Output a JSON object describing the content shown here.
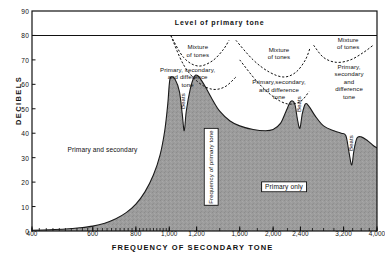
{
  "chart_data": {
    "type": "area",
    "title": "",
    "xlabel": "FREQUENCY OF SECONDARY TONE",
    "ylabel": "DECIBELS",
    "xscale": "log",
    "xlim": [
      400,
      4000
    ],
    "ylim": [
      0,
      90
    ],
    "grid": false,
    "legend": "none",
    "yticks": [
      0,
      10,
      20,
      30,
      40,
      50,
      60,
      70,
      80,
      90
    ],
    "ytick_labels": [
      "0",
      "10",
      "20",
      "30",
      "40",
      "50",
      "60",
      "70",
      "80",
      "90"
    ],
    "xticks": [
      400,
      600,
      800,
      1000,
      1200,
      1600,
      2000,
      2400,
      3200,
      4000
    ],
    "xtick_labels": [
      "400",
      "600",
      "800",
      "1,000",
      "1,200",
      "1,600",
      "2,000",
      "2,400",
      "3,200",
      "4,000"
    ],
    "series": [
      {
        "name": "masking-threshold",
        "type": "area",
        "fill": "#9a9a9a",
        "points": [
          [
            400,
            0.3
          ],
          [
            450,
            0.5
          ],
          [
            500,
            0.8
          ],
          [
            550,
            1.3
          ],
          [
            600,
            2.0
          ],
          [
            650,
            3.2
          ],
          [
            700,
            5.0
          ],
          [
            750,
            7.5
          ],
          [
            800,
            11.0
          ],
          [
            850,
            16.0
          ],
          [
            900,
            23.0
          ],
          [
            940,
            31.0
          ],
          [
            970,
            41.0
          ],
          [
            990,
            52.0
          ],
          [
            1000,
            60.0
          ],
          [
            1010,
            63.0
          ],
          [
            1040,
            62.0
          ],
          [
            1070,
            57.0
          ],
          [
            1090,
            48.0
          ],
          [
            1105,
            41.0
          ],
          [
            1120,
            49.0
          ],
          [
            1150,
            58.0
          ],
          [
            1180,
            63.0
          ],
          [
            1210,
            63.5
          ],
          [
            1260,
            60.0
          ],
          [
            1330,
            54.0
          ],
          [
            1400,
            49.0
          ],
          [
            1500,
            45.0
          ],
          [
            1600,
            43.0
          ],
          [
            1750,
            41.5
          ],
          [
            1900,
            41.0
          ],
          [
            2000,
            41.5
          ],
          [
            2100,
            44.0
          ],
          [
            2180,
            49.0
          ],
          [
            2250,
            53.0
          ],
          [
            2310,
            52.0
          ],
          [
            2350,
            46.0
          ],
          [
            2390,
            42.0
          ],
          [
            2430,
            48.0
          ],
          [
            2480,
            52.0
          ],
          [
            2540,
            51.0
          ],
          [
            2650,
            47.0
          ],
          [
            2800,
            43.0
          ],
          [
            3000,
            41.0
          ],
          [
            3150,
            40.0
          ],
          [
            3250,
            39.0
          ],
          [
            3320,
            32.0
          ],
          [
            3380,
            27.0
          ],
          [
            3430,
            33.0
          ],
          [
            3500,
            38.0
          ],
          [
            3600,
            38.5
          ],
          [
            3750,
            37.0
          ],
          [
            3900,
            35.0
          ],
          [
            4000,
            34.0
          ]
        ]
      },
      {
        "name": "primary-level-line",
        "type": "line",
        "value": 80
      },
      {
        "name": "mixture-boundary-left",
        "type": "dashed-curve",
        "points": [
          [
            1010,
            80
          ],
          [
            1100,
            71
          ],
          [
            1210,
            67.5
          ],
          [
            1330,
            69.5
          ],
          [
            1430,
            74
          ],
          [
            1490,
            78
          ]
        ]
      },
      {
        "name": "primary-secondary-difference-boundary-left",
        "type": "dashed-curve",
        "points": [
          [
            1010,
            80
          ],
          [
            1100,
            68
          ],
          [
            1210,
            61
          ],
          [
            1330,
            58
          ],
          [
            1450,
            59
          ],
          [
            1560,
            63
          ]
        ]
      },
      {
        "name": "mixture-boundary-mid",
        "type": "dashed-curve",
        "points": [
          [
            1560,
            78
          ],
          [
            1750,
            70
          ],
          [
            1950,
            65
          ],
          [
            2150,
            63
          ],
          [
            2330,
            65
          ],
          [
            2480,
            70
          ],
          [
            2560,
            75
          ]
        ]
      },
      {
        "name": "primary-secondary-difference-boundary-mid",
        "type": "dashed-curve",
        "points": [
          [
            1600,
            70
          ],
          [
            1800,
            61
          ],
          [
            2000,
            55
          ],
          [
            2200,
            52
          ],
          [
            2400,
            53
          ],
          [
            2540,
            57
          ]
        ]
      },
      {
        "name": "mixture-boundary-right",
        "type": "dashed-curve",
        "points": [
          [
            2620,
            76
          ],
          [
            2800,
            71
          ],
          [
            3050,
            69
          ],
          [
            3350,
            70
          ],
          [
            3650,
            73
          ],
          [
            3900,
            76
          ]
        ]
      }
    ],
    "annotations": [
      {
        "name": "level-of-primary-tone",
        "text": "Level  of  primary  tone",
        "x_hz": 1400,
        "y_db": 85,
        "style": "bold"
      },
      {
        "name": "primary-and-secondary",
        "text": "Primary and  secondary",
        "x_hz": 640,
        "y_db": 33
      },
      {
        "name": "primary-only",
        "text": "Primary only",
        "x_hz": 2150,
        "y_db": 18,
        "boxed": true
      },
      {
        "name": "frequency-of-primary-tone",
        "text": "Frequency of primary tone",
        "x_hz": 1320,
        "y_db": 26,
        "vertical": true,
        "boxed": true
      },
      {
        "name": "mixture-of-tones-left",
        "text": "Mixture\nof tones",
        "x_hz": 1210,
        "y_db": 74
      },
      {
        "name": "primary-secondary-and-difference-tone-left",
        "text": "Primary, secondary,\nand difference\ntone",
        "x_hz": 1130,
        "y_db": 63
      },
      {
        "name": "mixture-of-tones-mid",
        "text": "Mixture\nof tones",
        "x_hz": 2080,
        "y_db": 73
      },
      {
        "name": "primary-secondary-and-difference-tone-mid",
        "text": "Primary,secondary,\nand difference\ntone",
        "x_hz": 2080,
        "y_db": 58
      },
      {
        "name": "mixture-of-tones-right",
        "text": "Mixture\nof tones",
        "x_hz": 3300,
        "y_db": 77
      },
      {
        "name": "primary-secondary-and-difference-tone-right",
        "text": "Primary,\nsecondary\nand\ndifference\ntone",
        "x_hz": 3320,
        "y_db": 61
      },
      {
        "name": "beats-1",
        "text": "Beats",
        "x_hz": 1105,
        "y_db": 53,
        "vertical": true
      },
      {
        "name": "beats-2",
        "text": "Beats",
        "x_hz": 2390,
        "y_db": 52,
        "vertical": true
      },
      {
        "name": "beats-3",
        "text": "Beats",
        "x_hz": 3380,
        "y_db": 36,
        "vertical": true
      }
    ]
  }
}
